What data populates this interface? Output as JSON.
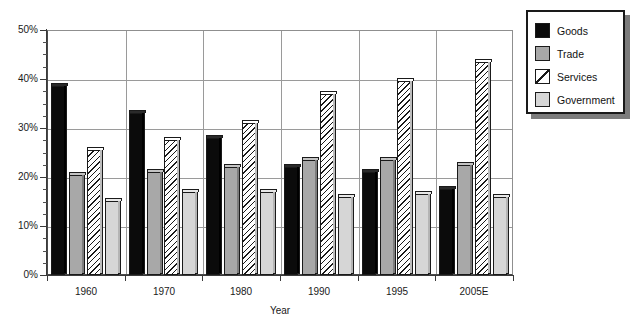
{
  "chart_data": {
    "type": "bar",
    "title": "",
    "xlabel": "Year",
    "ylabel": "",
    "categories": [
      "1960",
      "1970",
      "1980",
      "1990",
      "1995",
      "2005E"
    ],
    "ylim": [
      0,
      50
    ],
    "y_tick_labels": [
      "0%",
      "10%",
      "20%",
      "30%",
      "40%",
      "50%"
    ],
    "y_tick_values": [
      0,
      10,
      20,
      30,
      40,
      50
    ],
    "y_minor_tick_step": 2.5,
    "grid": "horizontal-and-vertical",
    "legend_position": "top-right",
    "series": [
      {
        "name": "Goods",
        "color": "#0b0b0b",
        "fill": "solid-black",
        "values": [
          38.5,
          33.0,
          28.0,
          22.0,
          21.0,
          17.5
        ]
      },
      {
        "name": "Trade",
        "color": "#a8a8a8",
        "fill": "solid-gray",
        "values": [
          20.5,
          21.0,
          22.0,
          23.5,
          23.5,
          22.5
        ]
      },
      {
        "name": "Services",
        "color": "#ffffff",
        "fill": "diagonal-hatch",
        "values": [
          25.5,
          27.5,
          31.0,
          37.0,
          39.5,
          43.5
        ]
      },
      {
        "name": "Government",
        "color": "#d6d6d6",
        "fill": "solid-light-gray",
        "values": [
          15.0,
          17.0,
          17.0,
          16.0,
          16.5,
          16.0
        ]
      }
    ]
  },
  "legend": {
    "items": [
      {
        "label": "Goods",
        "swatch": "solid-black-swatch"
      },
      {
        "label": "Trade",
        "swatch": "solid-gray-swatch"
      },
      {
        "label": "Services",
        "swatch": "diagonal-hatch-swatch"
      },
      {
        "label": "Government",
        "swatch": "solid-light-gray-swatch"
      }
    ]
  }
}
